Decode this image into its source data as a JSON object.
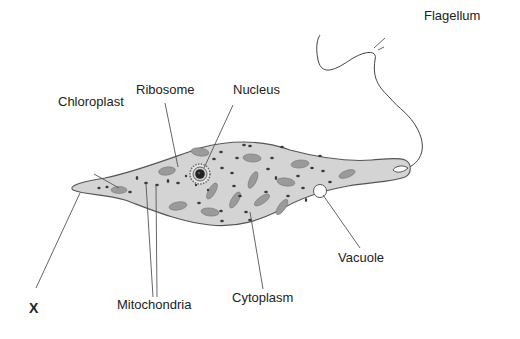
{
  "diagram": {
    "labels": {
      "flagellum": "Flagellum",
      "ribosome": "Ribosome",
      "nucleus": "Nucleus",
      "chloroplast": "Chloroplast",
      "vacuole": "Vacuole",
      "mitochondria": "Mitochondria",
      "cytoplasm": "Cytoplasm",
      "x": "X"
    },
    "colors": {
      "cell_fill": "#d4d4d4",
      "outline": "#555555",
      "chloroplast": "#9a9a9a",
      "dot": "#3a3a3a",
      "nucleus": "#222222",
      "text": "#222222"
    }
  }
}
